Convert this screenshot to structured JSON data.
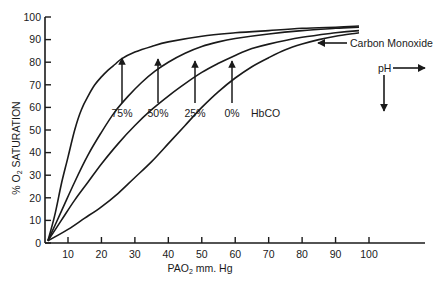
{
  "chart_data": {
    "type": "line",
    "title": "",
    "xlabel": "PAO2 mm. Hg",
    "ylabel": "% O2 SATURATION",
    "xlim": [
      3,
      113
    ],
    "ylim": [
      0,
      100
    ],
    "x_ticks": [
      10,
      20,
      30,
      40,
      50,
      60,
      70,
      80,
      90,
      100
    ],
    "y_ticks": [
      0,
      10,
      20,
      30,
      40,
      50,
      60,
      70,
      80,
      90,
      100
    ],
    "grid": false,
    "legend": "none",
    "series": [
      {
        "name": "75% HbCO",
        "points": [
          [
            4,
            1
          ],
          [
            6,
            12
          ],
          [
            8,
            26
          ],
          [
            10,
            38
          ],
          [
            12,
            50
          ],
          [
            14,
            59
          ],
          [
            16,
            65
          ],
          [
            18,
            70
          ],
          [
            20,
            73.5
          ],
          [
            22,
            76.5
          ],
          [
            24,
            79
          ],
          [
            26,
            81.5
          ],
          [
            30,
            84.5
          ],
          [
            35,
            87
          ],
          [
            40,
            89
          ],
          [
            50,
            91.5
          ],
          [
            60,
            93
          ],
          [
            70,
            94
          ],
          [
            80,
            95
          ],
          [
            90,
            95.5
          ],
          [
            97,
            96
          ]
        ]
      },
      {
        "name": "50% HbCO",
        "points": [
          [
            4,
            1
          ],
          [
            8,
            14
          ],
          [
            12,
            27
          ],
          [
            16,
            39
          ],
          [
            20,
            49
          ],
          [
            24,
            58
          ],
          [
            28,
            65
          ],
          [
            32,
            71
          ],
          [
            36,
            76
          ],
          [
            40,
            80
          ],
          [
            45,
            84
          ],
          [
            50,
            87
          ],
          [
            55,
            89
          ],
          [
            60,
            90.5
          ],
          [
            70,
            92.5
          ],
          [
            80,
            94
          ],
          [
            90,
            95
          ],
          [
            97,
            95.5
          ]
        ]
      },
      {
        "name": "25% HbCO",
        "points": [
          [
            4,
            1
          ],
          [
            8,
            10
          ],
          [
            12,
            19
          ],
          [
            16,
            27
          ],
          [
            20,
            35
          ],
          [
            25,
            44
          ],
          [
            30,
            52
          ],
          [
            35,
            59
          ],
          [
            40,
            65
          ],
          [
            45,
            70.5
          ],
          [
            50,
            75.5
          ],
          [
            55,
            79.5
          ],
          [
            60,
            83
          ],
          [
            65,
            86
          ],
          [
            70,
            88
          ],
          [
            80,
            91
          ],
          [
            90,
            93
          ],
          [
            97,
            94
          ]
        ]
      },
      {
        "name": "0% HbCO",
        "points": [
          [
            4,
            1
          ],
          [
            10,
            6
          ],
          [
            15,
            11
          ],
          [
            20,
            16
          ],
          [
            25,
            22
          ],
          [
            30,
            29
          ],
          [
            35,
            36
          ],
          [
            40,
            44
          ],
          [
            45,
            52
          ],
          [
            50,
            60
          ],
          [
            55,
            67
          ],
          [
            60,
            73
          ],
          [
            65,
            78
          ],
          [
            70,
            82
          ],
          [
            75,
            85.5
          ],
          [
            80,
            88
          ],
          [
            85,
            90
          ],
          [
            90,
            91.5
          ],
          [
            97,
            93
          ]
        ]
      }
    ],
    "annotations": [
      {
        "text": "75%",
        "arrow_x": 26,
        "arrow_from": 62,
        "arrow_to": 82
      },
      {
        "text": "50%",
        "arrow_x": 37,
        "arrow_from": 62,
        "arrow_to": 81
      },
      {
        "text": "25%",
        "arrow_x": 48,
        "arrow_from": 62,
        "arrow_to": 80
      },
      {
        "text": "0%",
        "arrow_x": 59,
        "arrow_from": 62,
        "arrow_to": 80
      },
      {
        "text": "HbCO"
      },
      {
        "text": "Carbon Monoxide",
        "arrow": "left"
      },
      {
        "text": "pH",
        "arrow": "right and down"
      }
    ]
  },
  "labels": {
    "xlabel_main": "PAO",
    "xlabel_sub": "2",
    "xlabel_rest": " mm. Hg",
    "ylabel_pre": "% O",
    "ylabel_sub": "2",
    "ylabel_rest": " SATURATION",
    "hbco": "HbCO",
    "carbon_monoxide": "Carbon Monoxide",
    "ph": "pH"
  },
  "colors": {
    "ink": "#1a1a1a",
    "background": "#ffffff"
  }
}
